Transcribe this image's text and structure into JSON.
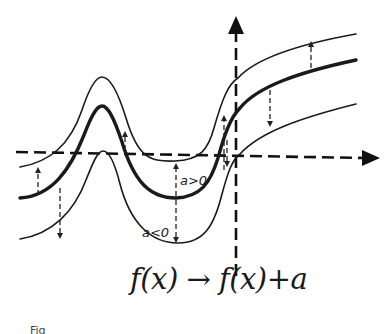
{
  "diagram": {
    "formula": {
      "lhs": "f(x)",
      "arrow": "→",
      "rhs": "f(x)+a",
      "full": "f(x) → f(x)+a"
    },
    "labels": {
      "a_positive": "a>0",
      "a_negative": "a<0"
    },
    "caption_fragment": "Fig",
    "axes": {
      "x_axis": {
        "style": "dashed",
        "arrow": "right"
      },
      "y_axis": {
        "style": "dashed",
        "arrow": "up"
      }
    },
    "curves": [
      {
        "name": "original",
        "label": "f(x)",
        "stroke": "thick"
      },
      {
        "name": "shifted-up",
        "label": "f(x)+a, a>0",
        "stroke": "thin"
      },
      {
        "name": "shifted-down",
        "label": "f(x)+a, a<0",
        "stroke": "thin"
      }
    ],
    "colors": {
      "ink": "#1a1a1a",
      "background": "#ffffff"
    }
  }
}
